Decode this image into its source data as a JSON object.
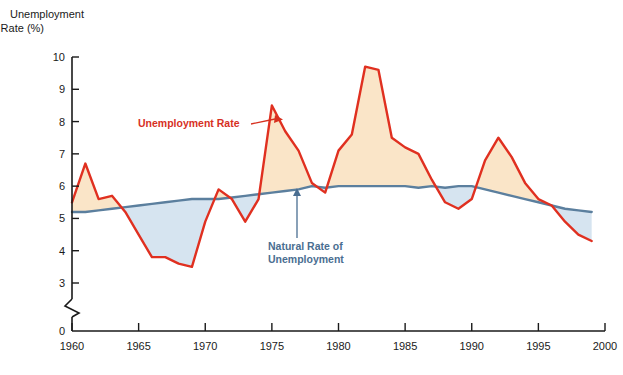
{
  "chart_data": {
    "type": "line",
    "title": "",
    "xlabel": "",
    "ylabel": "Unemployment\nRate (%)",
    "ylabel_line1": "Unemployment",
    "ylabel_line2": "Rate (%)",
    "xlim": [
      1960,
      2000
    ],
    "ylim": [
      0,
      10
    ],
    "y_break": true,
    "y_break_note": "axis broken between 3 and 0",
    "grid": false,
    "legend_position": "inline-annotations",
    "y_ticks": [
      0,
      3,
      4,
      5,
      6,
      7,
      8,
      9,
      10
    ],
    "y_tick_labels": [
      "0",
      "3",
      "4",
      "5",
      "6",
      "7",
      "8",
      "9",
      "10"
    ],
    "x_ticks": [
      1960,
      1965,
      1970,
      1975,
      1980,
      1985,
      1990,
      1995,
      2000
    ],
    "x_tick_labels": [
      "1960",
      "1965",
      "1970",
      "1975",
      "1980",
      "1985",
      "1990",
      "1995",
      "2000"
    ],
    "x": [
      1960,
      1961,
      1962,
      1963,
      1964,
      1965,
      1966,
      1967,
      1968,
      1969,
      1970,
      1971,
      1972,
      1973,
      1974,
      1975,
      1976,
      1977,
      1978,
      1979,
      1980,
      1981,
      1982,
      1983,
      1984,
      1985,
      1986,
      1987,
      1988,
      1989,
      1990,
      1991,
      1992,
      1993,
      1994,
      1995,
      1996,
      1997,
      1998,
      1999
    ],
    "series": [
      {
        "name": "Unemployment Rate",
        "color": "#E03020",
        "values": [
          5.5,
          6.7,
          5.6,
          5.7,
          5.2,
          4.5,
          3.8,
          3.8,
          3.6,
          3.5,
          4.9,
          5.9,
          5.6,
          4.9,
          5.6,
          8.5,
          7.7,
          7.1,
          6.1,
          5.8,
          7.1,
          7.6,
          9.7,
          9.6,
          7.5,
          7.2,
          7.0,
          6.2,
          5.5,
          5.3,
          5.6,
          6.8,
          7.5,
          6.9,
          6.1,
          5.6,
          5.4,
          4.9,
          4.5,
          4.3
        ]
      },
      {
        "name": "Natural Rate of Unemployment",
        "color": "#5B7F9E",
        "values": [
          5.2,
          5.2,
          5.25,
          5.3,
          5.35,
          5.4,
          5.45,
          5.5,
          5.55,
          5.6,
          5.6,
          5.6,
          5.65,
          5.7,
          5.75,
          5.8,
          5.85,
          5.9,
          6.0,
          5.95,
          6.0,
          6.0,
          6.0,
          6.0,
          6.0,
          6.0,
          5.95,
          6.0,
          5.95,
          6.0,
          6.0,
          5.9,
          5.8,
          5.7,
          5.6,
          5.5,
          5.4,
          5.3,
          5.25,
          5.2
        ]
      }
    ],
    "fill_above_natural_color": "#FAE5C8",
    "fill_below_natural_color": "#D6E4F0",
    "annotations": [
      {
        "id": "unemployment-rate-annotation",
        "text": "Unemployment Rate",
        "color": "#D7301F",
        "x": 138,
        "y": 127,
        "arrow_from_x": 251,
        "arrow_from_y": 124,
        "arrow_to_x": 282,
        "arrow_to_y": 118
      },
      {
        "id": "natural-rate-annotation",
        "line1": "Natural Rate of",
        "line2": "Unemployment",
        "color": "#4A6E91",
        "x": 268,
        "y": 250,
        "arrow_from_x": 297,
        "arrow_from_y": 236,
        "arrow_to_x": 297,
        "arrow_to_y": 190
      }
    ]
  }
}
